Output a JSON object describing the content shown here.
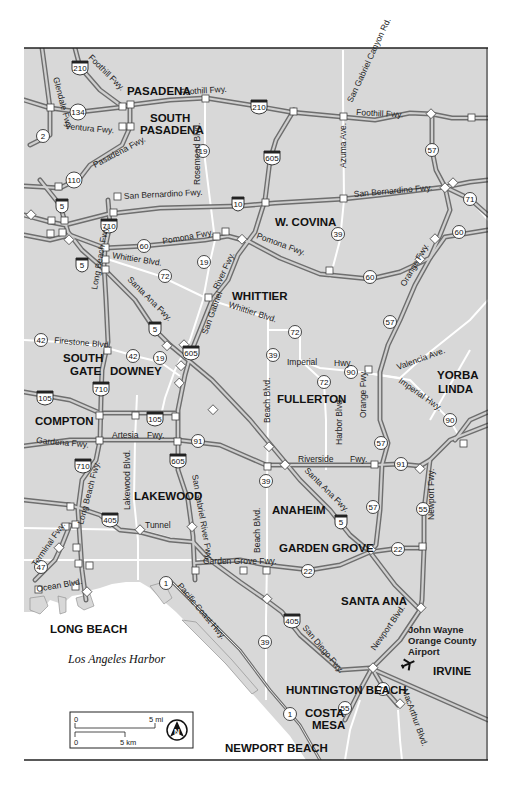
{
  "map": {
    "title": "Los Angeles & Orange County area freeway map",
    "colors": {
      "land": "#d8d8d8",
      "water": "#ffffff",
      "freeway_casing": "#6e6e6e",
      "freeway_fill": "#cfcfcf",
      "arterial": "#ffffff",
      "frame": "#222222",
      "interchange": "#ffffff"
    },
    "cities": [
      {
        "name": "PASADENA",
        "x": 127,
        "y": 95
      },
      {
        "name": "SOUTH",
        "x": 150,
        "y": 122
      },
      {
        "name": "PASADENA",
        "x": 140,
        "y": 134
      },
      {
        "name": "W. COVINA",
        "x": 275,
        "y": 226
      },
      {
        "name": "WHITTIER",
        "x": 232,
        "y": 300
      },
      {
        "name": "SOUTH",
        "x": 63,
        "y": 362
      },
      {
        "name": "GATE",
        "x": 70,
        "y": 375
      },
      {
        "name": "DOWNEY",
        "x": 110,
        "y": 375
      },
      {
        "name": "YORBA",
        "x": 437,
        "y": 379
      },
      {
        "name": "LINDA",
        "x": 438,
        "y": 393
      },
      {
        "name": "FULLERTON",
        "x": 277,
        "y": 403
      },
      {
        "name": "COMPTON",
        "x": 35,
        "y": 425
      },
      {
        "name": "LAKEWOOD",
        "x": 134,
        "y": 500
      },
      {
        "name": "ANAHEIM",
        "x": 272,
        "y": 514
      },
      {
        "name": "GARDEN GROVE",
        "x": 279,
        "y": 552
      },
      {
        "name": "SANTA ANA",
        "x": 341,
        "y": 605
      },
      {
        "name": "LONG BEACH",
        "x": 50,
        "y": 633
      },
      {
        "name": "IRVINE",
        "x": 433,
        "y": 675
      },
      {
        "name": "HUNTINGTON BEACH",
        "x": 286,
        "y": 694
      },
      {
        "name": "COSTA",
        "x": 305,
        "y": 717
      },
      {
        "name": "MESA",
        "x": 312,
        "y": 729
      },
      {
        "name": "NEWPORT BEACH",
        "x": 225,
        "y": 752
      }
    ],
    "airport": {
      "lines": [
        "John Wayne",
        "Orange County",
        "Airport"
      ],
      "icon": "airplane-icon"
    },
    "water_label": "Los Angeles Harbor",
    "roads": [
      {
        "name": "Glendale Fwy.",
        "x": 53,
        "y": 78,
        "rot": 75
      },
      {
        "name": "Foothill Fwy.",
        "x": 88,
        "y": 58,
        "rot": 45
      },
      {
        "name": "Foothill Fwy.",
        "x": 180,
        "y": 95,
        "rot": -4
      },
      {
        "name": "Foothill Fwy.",
        "x": 356,
        "y": 115,
        "rot": 3
      },
      {
        "name": "Ventura Fwy.",
        "x": 65,
        "y": 129,
        "rot": 5
      },
      {
        "name": "Pasadena Fwy.",
        "x": 95,
        "y": 168,
        "rot": -28
      },
      {
        "name": "Rosemead Blvd.",
        "x": 200,
        "y": 185,
        "rot": -90
      },
      {
        "name": "San Gabriel Canyon Rd.",
        "x": 352,
        "y": 103,
        "rot": -65
      },
      {
        "name": "Azuma Ave.",
        "x": 346,
        "y": 168,
        "rot": -90
      },
      {
        "name": "San Bernardino Fwy.",
        "x": 124,
        "y": 199,
        "rot": -3
      },
      {
        "name": "San Bernardino Fwy.",
        "x": 354,
        "y": 197,
        "rot": -5
      },
      {
        "name": "Pomona Fwy.",
        "x": 163,
        "y": 244,
        "rot": -10
      },
      {
        "name": "Pomona Fwy.",
        "x": 256,
        "y": 238,
        "rot": 20
      },
      {
        "name": "Long Beach Fwy.",
        "x": 97,
        "y": 290,
        "rot": -80
      },
      {
        "name": "Whittier Blvd.",
        "x": 112,
        "y": 258,
        "rot": 9
      },
      {
        "name": "Santa Ana Fwy.",
        "x": 127,
        "y": 280,
        "rot": 45
      },
      {
        "name": "River Fwy.",
        "x": 218,
        "y": 290,
        "rot": -65
      },
      {
        "name": "Whittier Blvd.",
        "x": 228,
        "y": 307,
        "rot": 18
      },
      {
        "name": "San Gabriel",
        "x": 207,
        "y": 335,
        "rot": -70
      },
      {
        "name": "Orange Fwy.",
        "x": 405,
        "y": 287,
        "rot": -60
      },
      {
        "name": "Firestone Blvd.",
        "x": 54,
        "y": 343,
        "rot": 5
      },
      {
        "name": "Imperial",
        "x": 287,
        "y": 365,
        "rot": 0
      },
      {
        "name": "Hwy.",
        "x": 334,
        "y": 366,
        "rot": 0
      },
      {
        "name": "Valencia Ave.",
        "x": 398,
        "y": 370,
        "rot": -20
      },
      {
        "name": "Imperial Hwy.",
        "x": 398,
        "y": 382,
        "rot": 35
      },
      {
        "name": "Beach Blvd.",
        "x": 270,
        "y": 423,
        "rot": -90
      },
      {
        "name": "Harbor Blvd.",
        "x": 342,
        "y": 445,
        "rot": -90
      },
      {
        "name": "Orange Fwy.",
        "x": 366,
        "y": 418,
        "rot": -90
      },
      {
        "name": "Gardena Fwy.",
        "x": 36,
        "y": 443,
        "rot": 5
      },
      {
        "name": "Artesia",
        "x": 112,
        "y": 438,
        "rot": 0
      },
      {
        "name": "Fwy.",
        "x": 147,
        "y": 438,
        "rot": 0
      },
      {
        "name": "Riverside",
        "x": 298,
        "y": 462,
        "rot": 0
      },
      {
        "name": "Fwy.",
        "x": 350,
        "y": 462,
        "rot": 0
      },
      {
        "name": "Lakewood Blvd.",
        "x": 130,
        "y": 510,
        "rot": -90
      },
      {
        "name": "Long Beach Fwy.",
        "x": 83,
        "y": 525,
        "rot": -75
      },
      {
        "name": "San Gabriel River Fwy.",
        "x": 192,
        "y": 475,
        "rot": 80
      },
      {
        "name": "Santa Ana Fwy.",
        "x": 304,
        "y": 471,
        "rot": 45
      },
      {
        "name": "Newport Fwy.",
        "x": 434,
        "y": 520,
        "rot": -90
      },
      {
        "name": "Tunnel",
        "x": 145,
        "y": 528,
        "rot": 0
      },
      {
        "name": "Beach Blvd.",
        "x": 260,
        "y": 553,
        "rot": -90
      },
      {
        "name": "Terminal Fwy.",
        "x": 36,
        "y": 567,
        "rot": -55
      },
      {
        "name": "Garden Grove Fwy.",
        "x": 203,
        "y": 564,
        "rot": 0
      },
      {
        "name": "Ocean Blvd.",
        "x": 37,
        "y": 592,
        "rot": -10
      },
      {
        "name": "Pacific Coast Hwy.",
        "x": 177,
        "y": 586,
        "rot": 50
      },
      {
        "name": "San Diego Fwy.",
        "x": 302,
        "y": 628,
        "rot": 50
      },
      {
        "name": "Newport Blvd.",
        "x": 375,
        "y": 651,
        "rot": -55
      },
      {
        "name": "MacArthur Blvd.",
        "x": 402,
        "y": 690,
        "rot": 70
      }
    ],
    "shields": [
      {
        "type": "interstate",
        "num": "210",
        "x": 80,
        "y": 67
      },
      {
        "type": "interstate",
        "num": "210",
        "x": 259,
        "y": 106
      },
      {
        "type": "state",
        "num": "134",
        "x": 78,
        "y": 112
      },
      {
        "type": "state",
        "num": "2",
        "x": 43,
        "y": 136
      },
      {
        "type": "state",
        "num": "110",
        "x": 74,
        "y": 180
      },
      {
        "type": "state",
        "num": "19",
        "x": 203,
        "y": 151
      },
      {
        "type": "state",
        "num": "57",
        "x": 432,
        "y": 150
      },
      {
        "type": "interstate",
        "num": "605",
        "x": 272,
        "y": 157
      },
      {
        "type": "interstate",
        "num": "5",
        "x": 62,
        "y": 205
      },
      {
        "type": "interstate",
        "num": "10",
        "x": 238,
        "y": 203
      },
      {
        "type": "interstate",
        "num": "710",
        "x": 109,
        "y": 225
      },
      {
        "type": "state",
        "num": "71",
        "x": 470,
        "y": 199
      },
      {
        "type": "state",
        "num": "60",
        "x": 144,
        "y": 246
      },
      {
        "type": "state",
        "num": "60",
        "x": 459,
        "y": 232
      },
      {
        "type": "state",
        "num": "60",
        "x": 370,
        "y": 277
      },
      {
        "type": "state",
        "num": "39",
        "x": 338,
        "y": 234
      },
      {
        "type": "interstate",
        "num": "5",
        "x": 82,
        "y": 264
      },
      {
        "type": "state",
        "num": "19",
        "x": 204,
        "y": 262
      },
      {
        "type": "state",
        "num": "72",
        "x": 165,
        "y": 276
      },
      {
        "type": "state",
        "num": "57",
        "x": 390,
        "y": 322
      },
      {
        "type": "interstate",
        "num": "5",
        "x": 155,
        "y": 328
      },
      {
        "type": "state",
        "num": "72",
        "x": 295,
        "y": 332
      },
      {
        "type": "state",
        "num": "42",
        "x": 41,
        "y": 340
      },
      {
        "type": "state",
        "num": "42",
        "x": 133,
        "y": 356
      },
      {
        "type": "state",
        "num": "19",
        "x": 160,
        "y": 358
      },
      {
        "type": "interstate",
        "num": "605",
        "x": 191,
        "y": 352
      },
      {
        "type": "state",
        "num": "39",
        "x": 273,
        "y": 355
      },
      {
        "type": "state",
        "num": "90",
        "x": 351,
        "y": 372
      },
      {
        "type": "state",
        "num": "72",
        "x": 324,
        "y": 382
      },
      {
        "type": "interstate",
        "num": "710",
        "x": 101,
        "y": 388
      },
      {
        "type": "interstate",
        "num": "105",
        "x": 45,
        "y": 397
      },
      {
        "type": "interstate",
        "num": "105",
        "x": 155,
        "y": 418
      },
      {
        "type": "state",
        "num": "90",
        "x": 450,
        "y": 420
      },
      {
        "type": "state",
        "num": "57",
        "x": 381,
        "y": 443
      },
      {
        "type": "state",
        "num": "91",
        "x": 198,
        "y": 441
      },
      {
        "type": "state",
        "num": "91",
        "x": 401,
        "y": 464
      },
      {
        "type": "state",
        "num": "39",
        "x": 266,
        "y": 481
      },
      {
        "type": "interstate",
        "num": "710",
        "x": 83,
        "y": 465
      },
      {
        "type": "interstate",
        "num": "605",
        "x": 178,
        "y": 460
      },
      {
        "type": "state",
        "num": "57",
        "x": 373,
        "y": 507
      },
      {
        "type": "state",
        "num": "55",
        "x": 423,
        "y": 509
      },
      {
        "type": "interstate",
        "num": "5",
        "x": 341,
        "y": 521
      },
      {
        "type": "interstate",
        "num": "405",
        "x": 110,
        "y": 519
      },
      {
        "type": "state",
        "num": "22",
        "x": 398,
        "y": 549
      },
      {
        "type": "state",
        "num": "22",
        "x": 308,
        "y": 571
      },
      {
        "type": "state",
        "num": "47",
        "x": 41,
        "y": 567
      },
      {
        "type": "state",
        "num": "1",
        "x": 166,
        "y": 583
      },
      {
        "type": "interstate",
        "num": "405",
        "x": 292,
        "y": 620
      },
      {
        "type": "state",
        "num": "39",
        "x": 265,
        "y": 642
      },
      {
        "type": "state",
        "num": "73",
        "x": 383,
        "y": 689
      },
      {
        "type": "state",
        "num": "55",
        "x": 345,
        "y": 708
      },
      {
        "type": "state",
        "num": "1",
        "x": 290,
        "y": 714
      }
    ],
    "scale_bar": {
      "mi_start": "0",
      "mi_end": "5 mi",
      "km_start": "0",
      "km_end": "5 km"
    },
    "compass": {
      "label": "N",
      "icon": "north-arrow-icon"
    }
  }
}
